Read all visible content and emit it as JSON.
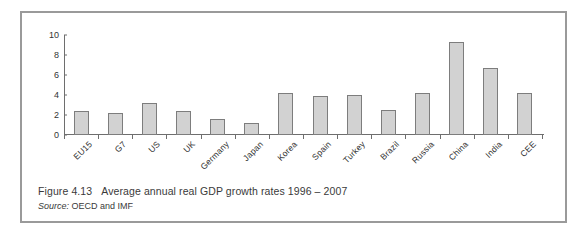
{
  "figure": {
    "caption_number": "Figure 4.13",
    "caption_title": "Average annual real GDP growth rates 1996 – 2007",
    "source_label": "Source:",
    "source_value": "OECD and IMF"
  },
  "colors": {
    "bar_fill": "#d2d2d2",
    "bar_border": "#7d7d7d",
    "axis": "#6e6e6e",
    "frame": "#9a9a9a",
    "text": "#3a3a3a",
    "background": "#ffffff"
  },
  "chart_data": {
    "type": "bar",
    "title": "Average annual real GDP growth rates 1996 – 2007",
    "xlabel": "",
    "ylabel": "",
    "ylim": [
      0,
      10
    ],
    "yticks": [
      0,
      2,
      4,
      6,
      8,
      10
    ],
    "grid": false,
    "legend": "none",
    "categories": [
      "EU15",
      "G7",
      "US",
      "UK",
      "Germany",
      "Japan",
      "Korea",
      "Spain",
      "Turkey",
      "Brazil",
      "Russia",
      "China",
      "India",
      "CEE"
    ],
    "values": [
      2.4,
      2.2,
      3.2,
      2.4,
      1.6,
      1.2,
      4.2,
      3.9,
      4.0,
      2.5,
      4.2,
      9.3,
      6.7,
      4.2
    ]
  }
}
